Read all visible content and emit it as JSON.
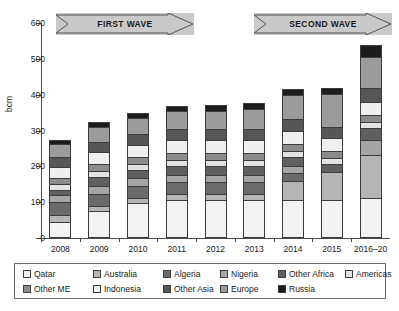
{
  "chart_data": {
    "type": "bar",
    "title": "",
    "xlabel": "",
    "ylabel": "bcm",
    "ylim": [
      0,
      600
    ],
    "yticks": [
      0,
      100,
      200,
      300,
      400,
      500,
      600
    ],
    "grid": false,
    "stacked": true,
    "legend_position": "bottom",
    "categories": [
      "2008",
      "2009",
      "2010",
      "2011",
      "2012",
      "2013",
      "2014",
      "2015",
      "2016–20"
    ],
    "series": [
      {
        "name": "Qatar",
        "color": "#f2f2f2",
        "values": [
          45,
          76,
          97,
          107,
          107,
          107,
          107,
          107,
          113
        ]
      },
      {
        "name": "Australia",
        "color": "#b5b5b5",
        "values": [
          20,
          12,
          15,
          15,
          15,
          15,
          53,
          76,
          119
        ]
      },
      {
        "name": "Algeria",
        "color": "#6b6b6b",
        "values": [
          35,
          36,
          34,
          34,
          34,
          34,
          22,
          0,
          0
        ]
      },
      {
        "name": "Nigeria",
        "color": "#a5a5a5",
        "values": [
          21,
          22,
          21,
          21,
          20,
          21,
          20,
          0,
          41
        ]
      },
      {
        "name": "Other Africa",
        "color": "#5f5f5f",
        "values": [
          13,
          25,
          22,
          25,
          25,
          25,
          25,
          24,
          33
        ]
      },
      {
        "name": "Americas",
        "color": "#e3e3e3",
        "values": [
          16,
          17,
          17,
          17,
          17,
          17,
          17,
          17,
          17
        ]
      },
      {
        "name": "Other ME",
        "color": "#8c8c8c",
        "values": [
          18,
          18,
          19,
          19,
          19,
          19,
          19,
          19,
          21
        ]
      },
      {
        "name": "Indonesia",
        "color": "#efefef",
        "values": [
          29,
          33,
          36,
          36,
          36,
          36,
          37,
          37,
          37
        ]
      },
      {
        "name": "Other Asia",
        "color": "#565656",
        "values": [
          29,
          30,
          30,
          31,
          31,
          31,
          31,
          31,
          39
        ]
      },
      {
        "name": "Europe",
        "color": "#9b9b9b",
        "values": [
          36,
          42,
          43,
          50,
          50,
          56,
          68,
          91,
          86
        ]
      },
      {
        "name": "Russia",
        "color": "#1c1c1c",
        "values": [
          11,
          13,
          14,
          13,
          18,
          17,
          18,
          17,
          33
        ]
      }
    ],
    "totals": [
      273,
      324,
      348,
      368,
      372,
      378,
      417,
      419,
      539
    ],
    "annotations": [
      {
        "name": "first-wave",
        "label": "FIRST WAVE"
      },
      {
        "name": "second-wave",
        "label": "SECOND WAVE"
      }
    ]
  },
  "axes": {
    "y_title": "bcm",
    "y_tick_labels": [
      "600",
      "500",
      "400",
      "300",
      "200",
      "100",
      "0"
    ],
    "x_tick_labels": [
      "2008",
      "2009",
      "2010",
      "2011",
      "2012",
      "2013",
      "2014",
      "2015",
      "2016–20"
    ]
  },
  "waves": {
    "first": "FIRST WAVE",
    "second": "SECOND WAVE"
  },
  "legend": {
    "row1": [
      {
        "label": "Qatar",
        "color": "#f2f2f2"
      },
      {
        "label": "Australia",
        "color": "#b5b5b5"
      },
      {
        "label": "Algeria",
        "color": "#6b6b6b"
      },
      {
        "label": "Nigeria",
        "color": "#a5a5a5"
      },
      {
        "label": "Other Africa",
        "color": "#5f5f5f"
      },
      {
        "label": "Americas",
        "color": "#e3e3e3"
      }
    ],
    "row2": [
      {
        "label": "Other ME",
        "color": "#8c8c8c"
      },
      {
        "label": "Indonesia",
        "color": "#efefef"
      },
      {
        "label": "Other Asia",
        "color": "#565656"
      },
      {
        "label": "Europe",
        "color": "#9b9b9b"
      },
      {
        "label": "Russia",
        "color": "#1c1c1c"
      }
    ]
  }
}
